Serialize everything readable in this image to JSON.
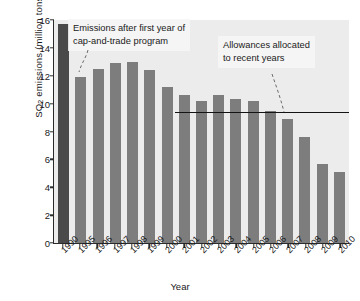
{
  "chart_data": {
    "type": "bar",
    "title": "",
    "xlabel": "Year",
    "ylabel": "SO2 emissions (million tons)",
    "ylabel_parts": {
      "pre": "SO",
      "sub": "2",
      "post": " emissions (million tons)"
    },
    "categories": [
      "1990",
      "1995",
      "1996",
      "1997",
      "1998",
      "1999",
      "2000",
      "2001",
      "2002",
      "2003",
      "2004",
      "2005",
      "2006",
      "2007",
      "2008",
      "2009",
      "2010"
    ],
    "values": [
      15.7,
      11.9,
      12.5,
      12.9,
      13.0,
      12.4,
      11.2,
      10.6,
      10.2,
      10.6,
      10.3,
      10.2,
      9.5,
      8.9,
      7.6,
      5.7,
      5.1
    ],
    "bar_colors": [
      "#4a4a4a",
      "#7d7d7d",
      "#7d7d7d",
      "#7d7d7d",
      "#7d7d7d",
      "#7d7d7d",
      "#7d7d7d",
      "#7d7d7d",
      "#7d7d7d",
      "#7d7d7d",
      "#7d7d7d",
      "#7d7d7d",
      "#7d7d7d",
      "#7d7d7d",
      "#7d7d7d",
      "#7d7d7d",
      "#7d7d7d"
    ],
    "ylim": [
      0,
      16
    ],
    "yticks": [
      0,
      2,
      4,
      6,
      8,
      10,
      12,
      14,
      16
    ],
    "grid": false,
    "legend": null,
    "plot_background": "#ececec",
    "reference_line": {
      "label": "Allowances allocated to recent years",
      "value": 9.3,
      "starts_at_category": "2001",
      "color": "#141414"
    },
    "annotations": [
      {
        "id": "note1",
        "text": "Emissions after first year of\ncap-and-trade program",
        "points_to_category": "1995"
      },
      {
        "id": "note2",
        "text": "Allowances allocated\nto recent years",
        "points_to_category": "2008"
      }
    ]
  }
}
